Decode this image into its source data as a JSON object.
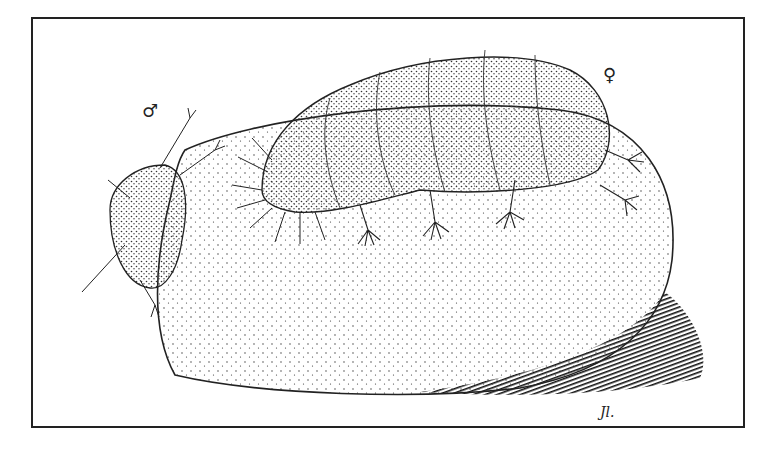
{
  "illustration": {
    "subject": "Stipple drawing of two tardigrades on a rock",
    "male_symbol": "♂",
    "female_symbol": "♀",
    "signature": "Jl.",
    "colors": {
      "ink": "#222222",
      "paper": "#ffffff"
    }
  }
}
